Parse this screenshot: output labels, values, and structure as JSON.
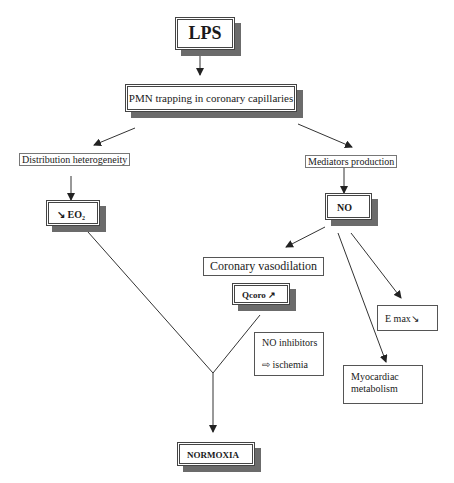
{
  "diagram": {
    "nodes": {
      "lps": {
        "label": "LPS"
      },
      "pmn": {
        "label": "PMN trapping in coronary capillaries"
      },
      "distribution": {
        "label": "Distribution heterogeneity"
      },
      "mediators": {
        "label": "Mediators production"
      },
      "eo2": {
        "label": "↘ EO₂"
      },
      "no": {
        "label": "NO"
      },
      "vasodilation": {
        "label": "Coronary vasodilation"
      },
      "qcoro": {
        "label": "Qcoro ↗"
      },
      "no_inhibitors": {
        "line1": "NO inhibitors",
        "line2_icon": "⇨",
        "line2": "ischemia"
      },
      "emax": {
        "label": "E max↘"
      },
      "myocardiac": {
        "line1": "Myocardiac",
        "line2": "metabolism"
      },
      "normoxia": {
        "label": "NORMOXIA"
      }
    },
    "edges": [
      {
        "from": "lps",
        "to": "pmn"
      },
      {
        "from": "pmn",
        "to": "distribution"
      },
      {
        "from": "pmn",
        "to": "mediators"
      },
      {
        "from": "distribution",
        "to": "eo2"
      },
      {
        "from": "mediators",
        "to": "no"
      },
      {
        "from": "no",
        "to": "vasodilation"
      },
      {
        "from": "no",
        "to": "emax"
      },
      {
        "from": "no",
        "to": "myocardiac"
      },
      {
        "from": "eo2",
        "to": "normoxia",
        "via": "junction"
      },
      {
        "from": "qcoro",
        "to": "normoxia",
        "via": "junction"
      }
    ]
  }
}
